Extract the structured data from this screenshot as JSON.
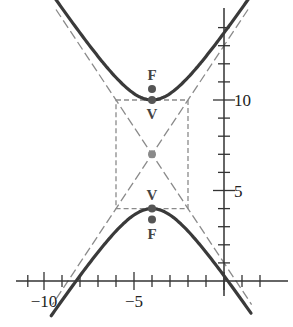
{
  "chart_data": {
    "type": "line",
    "title": "",
    "xlabel": "",
    "ylabel": "",
    "xlim": [
      -10.5,
      2.8
    ],
    "ylim": [
      -1.5,
      15.5
    ],
    "x_ticks": [
      -10,
      -9,
      -8,
      -7,
      -6,
      -5,
      -4,
      -3,
      -2,
      -1,
      0,
      1,
      2
    ],
    "y_ticks": [
      1,
      2,
      3,
      4,
      5,
      6,
      7,
      8,
      9,
      10,
      11,
      12,
      13,
      14
    ],
    "x_tick_labels": [
      {
        "value": -10,
        "text": "−10"
      },
      {
        "value": -5,
        "text": "−5"
      }
    ],
    "y_tick_labels": [
      {
        "value": 10,
        "text": "10"
      },
      {
        "value": 5,
        "text": "5"
      }
    ],
    "grid": false,
    "hyperbola": {
      "equation": "(y-7)^2/9 - (x+4)^2/4 = 1",
      "center": [
        -4,
        7
      ],
      "a": 3,
      "b": 2,
      "orientation": "vertical"
    },
    "asymptotes": [
      {
        "name": "asymptote-positive",
        "slope": 1.5,
        "through": [
          -4,
          7
        ]
      },
      {
        "name": "asymptote-negative",
        "slope": -1.5,
        "through": [
          -4,
          7
        ]
      }
    ],
    "fundamental_rectangle": {
      "x": [
        -6,
        -2
      ],
      "y": [
        4,
        10
      ]
    },
    "points": [
      {
        "name": "center",
        "x": -4,
        "y": 7,
        "label": ""
      },
      {
        "name": "vertex-upper",
        "x": -4,
        "y": 10,
        "label": "V",
        "label_pos": "below"
      },
      {
        "name": "vertex-lower",
        "x": -4,
        "y": 4,
        "label": "V",
        "label_pos": "above"
      },
      {
        "name": "focus-upper",
        "x": -4,
        "y": 10.606,
        "label": "F",
        "label_pos": "above"
      },
      {
        "name": "focus-lower",
        "x": -4,
        "y": 3.394,
        "label": "F",
        "label_pos": "below"
      }
    ],
    "colors": {
      "curve": "#3a3a3a",
      "dashed": "#8a8a8a",
      "axis": "#333333",
      "point": "#555555",
      "center_point": "#8a8a8a"
    }
  }
}
